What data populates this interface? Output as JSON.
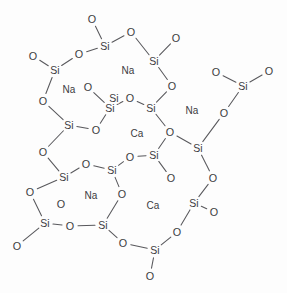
{
  "diagram": {
    "type": "chemical-structure",
    "width": 287,
    "height": 293,
    "background_color": "#fdfdfd",
    "bond_color": "#58585c",
    "label_color": "#3b3b3f",
    "symbols": {
      "silicon": "Si",
      "oxygen": "O",
      "sodium": "Na",
      "calcium": "Ca"
    }
  },
  "chart_data": {
    "type": "diagram",
    "xlabel": "",
    "ylabel": "",
    "counts": {
      "silicon": 16,
      "oxygen": 31,
      "sodium": 4,
      "calcium": 2
    },
    "atoms": [
      {
        "id": "O1",
        "element": "O",
        "label": "O",
        "x": 92,
        "y": 19
      },
      {
        "id": "Si1",
        "element": "Si",
        "label": "Si",
        "x": 105,
        "y": 46
      },
      {
        "id": "O2",
        "element": "O",
        "label": "O",
        "x": 79,
        "y": 54
      },
      {
        "id": "O3",
        "element": "O",
        "label": "O",
        "x": 131,
        "y": 32
      },
      {
        "id": "Si2",
        "element": "Si",
        "label": "Si",
        "x": 154,
        "y": 61
      },
      {
        "id": "O4",
        "element": "O",
        "label": "O",
        "x": 176,
        "y": 38
      },
      {
        "id": "O5",
        "element": "O",
        "label": "O",
        "x": 172,
        "y": 86
      },
      {
        "id": "Si3",
        "element": "Si",
        "label": "Si",
        "x": 55,
        "y": 70
      },
      {
        "id": "O6",
        "element": "O",
        "label": "O",
        "x": 33,
        "y": 56
      },
      {
        "id": "O7",
        "element": "O",
        "label": "O",
        "x": 43,
        "y": 101
      },
      {
        "id": "Si4",
        "element": "Si",
        "label": "Si",
        "x": 69,
        "y": 125
      },
      {
        "id": "O8",
        "element": "O",
        "label": "O",
        "x": 96,
        "y": 130
      },
      {
        "id": "Si5",
        "element": "Si",
        "label": "Si",
        "x": 110,
        "y": 108
      },
      {
        "id": "O9",
        "element": "O",
        "label": "O",
        "x": 88,
        "y": 87
      },
      {
        "id": "O10",
        "element": "O",
        "label": "O",
        "x": 130,
        "y": 98
      },
      {
        "id": "Si6",
        "element": "Si",
        "label": "Si",
        "x": 151,
        "y": 108
      },
      {
        "id": "O11",
        "element": "O",
        "label": "O",
        "x": 170,
        "y": 132
      },
      {
        "id": "Si7",
        "element": "Si",
        "label": "Si",
        "x": 198,
        "y": 148
      },
      {
        "id": "O12",
        "element": "O",
        "label": "O",
        "x": 224,
        "y": 113
      },
      {
        "id": "Si8",
        "element": "Si",
        "label": "Si",
        "x": 243,
        "y": 86
      },
      {
        "id": "O13",
        "element": "O",
        "label": "O",
        "x": 216,
        "y": 72
      },
      {
        "id": "O14",
        "element": "O",
        "label": "O",
        "x": 269,
        "y": 71
      },
      {
        "id": "O15",
        "element": "O",
        "label": "O",
        "x": 213,
        "y": 178
      },
      {
        "id": "Si9",
        "element": "Si",
        "label": "Si",
        "x": 194,
        "y": 203
      },
      {
        "id": "O16",
        "element": "O",
        "label": "O",
        "x": 214,
        "y": 212
      },
      {
        "id": "O17",
        "element": "O",
        "label": "O",
        "x": 177,
        "y": 232
      },
      {
        "id": "Si10",
        "element": "Si",
        "label": "Si",
        "x": 155,
        "y": 250
      },
      {
        "id": "O18",
        "element": "O",
        "label": "O",
        "x": 150,
        "y": 276
      },
      {
        "id": "O19",
        "element": "O",
        "label": "O",
        "x": 123,
        "y": 243
      },
      {
        "id": "Si11",
        "element": "Si",
        "label": "Si",
        "x": 103,
        "y": 225
      },
      {
        "id": "O20",
        "element": "O",
        "label": "O",
        "x": 70,
        "y": 226
      },
      {
        "id": "Si12",
        "element": "Si",
        "label": "Si",
        "x": 45,
        "y": 223
      },
      {
        "id": "O21",
        "element": "O",
        "label": "O",
        "x": 17,
        "y": 246
      },
      {
        "id": "O22",
        "element": "O",
        "label": "O",
        "x": 30,
        "y": 192
      },
      {
        "id": "Si13",
        "element": "Si",
        "label": "Si",
        "x": 64,
        "y": 177
      },
      {
        "id": "O23",
        "element": "O",
        "label": "O",
        "x": 43,
        "y": 152
      },
      {
        "id": "O24",
        "element": "O",
        "label": "O",
        "x": 86,
        "y": 164
      },
      {
        "id": "Si14",
        "element": "Si",
        "label": "Si",
        "x": 112,
        "y": 170
      },
      {
        "id": "O25",
        "element": "O",
        "label": "O",
        "x": 122,
        "y": 194
      },
      {
        "id": "O26",
        "element": "O",
        "label": "O",
        "x": 130,
        "y": 157
      },
      {
        "id": "Si15",
        "element": "Si",
        "label": "Si",
        "x": 154,
        "y": 155
      },
      {
        "id": "O27",
        "element": "O",
        "label": "O",
        "x": 171,
        "y": 178
      },
      {
        "id": "O28",
        "element": "O",
        "label": "O",
        "x": 61,
        "y": 204
      },
      {
        "id": "Si16",
        "element": "Si",
        "label": "Si",
        "x": 114,
        "y": 98
      }
    ],
    "bonds": [
      {
        "from": "O1",
        "to": "Si1"
      },
      {
        "from": "Si1",
        "to": "O2"
      },
      {
        "from": "Si1",
        "to": "O3"
      },
      {
        "from": "O3",
        "to": "Si2"
      },
      {
        "from": "Si2",
        "to": "O4"
      },
      {
        "from": "Si2",
        "to": "O5"
      },
      {
        "from": "O2",
        "to": "Si3"
      },
      {
        "from": "Si3",
        "to": "O6"
      },
      {
        "from": "Si3",
        "to": "O7"
      },
      {
        "from": "O7",
        "to": "Si4"
      },
      {
        "from": "Si4",
        "to": "O8"
      },
      {
        "from": "O9",
        "to": "Si5"
      },
      {
        "from": "Si5",
        "to": "O8"
      },
      {
        "from": "Si5",
        "to": "O10"
      },
      {
        "from": "O10",
        "to": "Si6"
      },
      {
        "from": "Si6",
        "to": "O11"
      },
      {
        "from": "O5",
        "to": "Si6"
      },
      {
        "from": "O11",
        "to": "Si7"
      },
      {
        "from": "Si7",
        "to": "O12"
      },
      {
        "from": "O12",
        "to": "Si8"
      },
      {
        "from": "Si8",
        "to": "O13"
      },
      {
        "from": "Si8",
        "to": "O14"
      },
      {
        "from": "Si7",
        "to": "O15"
      },
      {
        "from": "O15",
        "to": "Si9"
      },
      {
        "from": "Si9",
        "to": "O16"
      },
      {
        "from": "Si9",
        "to": "O17"
      },
      {
        "from": "O17",
        "to": "Si10"
      },
      {
        "from": "Si10",
        "to": "O18"
      },
      {
        "from": "Si10",
        "to": "O19"
      },
      {
        "from": "O19",
        "to": "Si11"
      },
      {
        "from": "Si11",
        "to": "O20"
      },
      {
        "from": "O20",
        "to": "Si12"
      },
      {
        "from": "Si12",
        "to": "O21"
      },
      {
        "from": "Si12",
        "to": "O22"
      },
      {
        "from": "O22",
        "to": "Si13"
      },
      {
        "from": "Si13",
        "to": "O23"
      },
      {
        "from": "O23",
        "to": "Si4"
      },
      {
        "from": "Si13",
        "to": "O24"
      },
      {
        "from": "O24",
        "to": "Si14"
      },
      {
        "from": "Si14",
        "to": "O25"
      },
      {
        "from": "O25",
        "to": "Si11"
      },
      {
        "from": "Si14",
        "to": "O26"
      },
      {
        "from": "O26",
        "to": "Si15"
      },
      {
        "from": "Si15",
        "to": "O27"
      },
      {
        "from": "Si15",
        "to": "O11"
      }
    ],
    "ions": [
      {
        "id": "Na1",
        "element": "Na",
        "label": "Na",
        "x": 128,
        "y": 70
      },
      {
        "id": "Na2",
        "element": "Na",
        "label": "Na",
        "x": 69,
        "y": 89
      },
      {
        "id": "Na3",
        "element": "Na",
        "label": "Na",
        "x": 192,
        "y": 110
      },
      {
        "id": "Na4",
        "element": "Na",
        "label": "Na",
        "x": 91,
        "y": 195
      },
      {
        "id": "Ca1",
        "element": "Ca",
        "label": "Ca",
        "x": 137,
        "y": 133
      },
      {
        "id": "Ca2",
        "element": "Ca",
        "label": "Ca",
        "x": 153,
        "y": 205
      }
    ]
  }
}
